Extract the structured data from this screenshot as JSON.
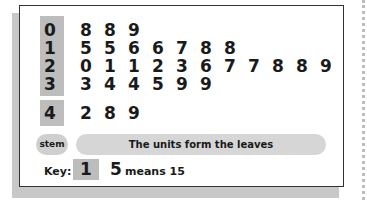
{
  "chart_data": {
    "type": "table",
    "rows": [
      {
        "stem": "0",
        "leaves": [
          "8",
          "8",
          "9"
        ]
      },
      {
        "stem": "1",
        "leaves": [
          "5",
          "5",
          "6",
          "6",
          "7",
          "8",
          "8"
        ]
      },
      {
        "stem": "2",
        "leaves": [
          "0",
          "1",
          "1",
          "2",
          "3",
          "6",
          "7",
          "7",
          "8",
          "8",
          "9"
        ]
      },
      {
        "stem": "3",
        "leaves": [
          "3",
          "4",
          "4",
          "5",
          "9",
          "9"
        ]
      },
      {
        "stem": "4",
        "leaves": [
          "2",
          "8",
          "9"
        ]
      }
    ],
    "values": [
      8,
      8,
      9,
      15,
      15,
      16,
      16,
      17,
      18,
      18,
      20,
      21,
      21,
      22,
      23,
      26,
      27,
      27,
      28,
      28,
      29,
      33,
      34,
      34,
      35,
      39,
      39,
      42,
      48,
      49
    ]
  },
  "legend": {
    "stem_label": "stem",
    "description": "The units form the leaves"
  },
  "key": {
    "label": "Key:",
    "stem": "1",
    "leaf": "5",
    "means": "means 15"
  }
}
